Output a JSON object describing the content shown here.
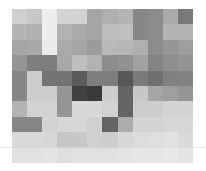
{
  "chart_data": {
    "type": "heatmap",
    "title": "",
    "xlabel": "",
    "ylabel": "",
    "colormap": "grayscale",
    "rows": 10,
    "cols": 12,
    "legend": null,
    "grid": false,
    "values": [
      [
        208,
        200,
        238,
        212,
        210,
        165,
        175,
        180,
        135,
        140,
        170,
        120
      ],
      [
        180,
        175,
        238,
        178,
        170,
        165,
        190,
        192,
        135,
        140,
        180,
        180
      ],
      [
        165,
        168,
        235,
        170,
        165,
        155,
        185,
        182,
        175,
        140,
        150,
        158
      ],
      [
        150,
        125,
        125,
        168,
        190,
        178,
        140,
        145,
        162,
        132,
        142,
        148
      ],
      [
        135,
        205,
        115,
        115,
        90,
        125,
        125,
        88,
        122,
        112,
        128,
        130
      ],
      [
        135,
        205,
        205,
        150,
        65,
        58,
        205,
        100,
        200,
        165,
        158,
        150
      ],
      [
        180,
        210,
        210,
        150,
        215,
        215,
        210,
        100,
        205,
        205,
        212,
        212
      ],
      [
        135,
        135,
        210,
        215,
        215,
        208,
        100,
        172,
        212,
        212,
        215,
        215
      ],
      [
        218,
        218,
        215,
        198,
        200,
        208,
        205,
        215,
        220,
        222,
        225,
        218
      ],
      [
        225,
        225,
        228,
        222,
        225,
        225,
        225,
        228,
        230,
        230,
        232,
        228
      ]
    ]
  },
  "overlay": {
    "horizontal_line_y": 147,
    "line_color": "#d8d8d8"
  }
}
